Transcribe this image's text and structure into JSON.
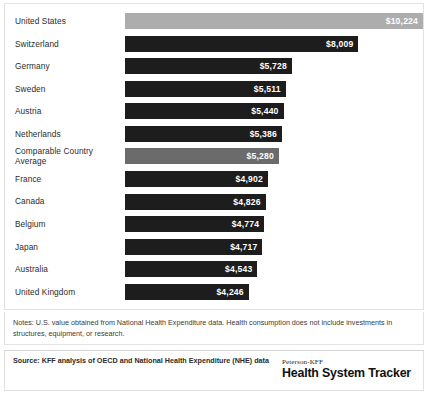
{
  "chart_data": {
    "type": "bar",
    "orientation": "horizontal",
    "title": "",
    "subtitle": "",
    "xlabel": "",
    "ylabel": "",
    "grid": false,
    "legend": "none",
    "value_prefix": "$",
    "xlim": [
      0,
      10224
    ],
    "categories": [
      "United States",
      "Switzerland",
      "Germany",
      "Sweden",
      "Austria",
      "Netherlands",
      "Comparable Country\nAverage",
      "France",
      "Canada",
      "Belgium",
      "Japan",
      "Australia",
      "United Kingdom"
    ],
    "values": [
      10224,
      8009,
      5728,
      5511,
      5440,
      5386,
      5280,
      4902,
      4826,
      4774,
      4717,
      4543,
      4246
    ],
    "value_labels": [
      "$10,224",
      "$8,009",
      "$5,728",
      "$5,511",
      "$5,440",
      "$5,386",
      "$5,280",
      "$4,902",
      "$4,826",
      "$4,774",
      "$4,717",
      "$4,543",
      "$4,246"
    ],
    "bar_colors": [
      "#adadad",
      "#1d1d1d",
      "#1d1d1d",
      "#1d1d1d",
      "#1d1d1d",
      "#1d1d1d",
      "#6b6b6b",
      "#1d1d1d",
      "#1d1d1d",
      "#1d1d1d",
      "#1d1d1d",
      "#1d1d1d",
      "#1d1d1d"
    ]
  },
  "colors": {
    "highlight_gray": "#adadad",
    "average_gray": "#6b6b6b",
    "bar_dark": "#1d1d1d",
    "panel_border": "#e2e2e2",
    "text": "#231f20",
    "value_text": "#ffffff"
  },
  "notes": {
    "text": "Notes: U.S. value obtained from National Health Expenditure data. Health consumption does not include investments in structures, equipment, or research."
  },
  "source": {
    "text": "Source: KFF analysis of OECD and National Health Expenditure (NHE) data"
  },
  "logo": {
    "top": "Peterson-KFF",
    "main": "Health System Tracker"
  }
}
